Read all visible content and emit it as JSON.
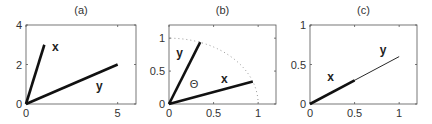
{
  "chart_data": [
    {
      "type": "line",
      "title": "(a)",
      "xlim": [
        0,
        6
      ],
      "ylim": [
        0,
        4
      ],
      "xticks": [
        0,
        5
      ],
      "yticks": [
        0,
        2,
        4
      ],
      "grid": false,
      "series": [
        {
          "name": "x",
          "x": [
            0,
            1
          ],
          "y": [
            0,
            3
          ],
          "style": "thick"
        },
        {
          "name": "y",
          "x": [
            0,
            5
          ],
          "y": [
            0,
            2
          ],
          "style": "thick"
        }
      ],
      "annotations": [
        {
          "text": "x",
          "x": 1.6,
          "y": 2.9
        },
        {
          "text": "y",
          "x": 4.0,
          "y": 0.9
        }
      ]
    },
    {
      "type": "line",
      "title": "(b)",
      "xlim": [
        0,
        1.2
      ],
      "ylim": [
        0,
        1.2
      ],
      "xticks": [
        0,
        0.5,
        1
      ],
      "yticks": [
        0,
        0.5,
        1
      ],
      "grid": false,
      "series": [
        {
          "name": "x",
          "x": [
            0,
            0.94
          ],
          "y": [
            0,
            0.34
          ],
          "style": "thick"
        },
        {
          "name": "y",
          "x": [
            0,
            0.35
          ],
          "y": [
            0,
            0.94
          ],
          "style": "thick"
        },
        {
          "name": "unit circle",
          "type": "arc",
          "radius": 1,
          "style": "dotted"
        }
      ],
      "annotations": [
        {
          "text": "y",
          "x": 0.12,
          "y": 0.78
        },
        {
          "text": "x",
          "x": 0.62,
          "y": 0.38
        },
        {
          "text": "Θ",
          "x": 0.28,
          "y": 0.3
        }
      ]
    },
    {
      "type": "line",
      "title": "(c)",
      "xlim": [
        0,
        1.2
      ],
      "ylim": [
        0,
        1
      ],
      "xticks": [
        0,
        0.5,
        1
      ],
      "yticks": [
        0,
        0.5,
        1
      ],
      "grid": false,
      "series": [
        {
          "name": "y",
          "x": [
            0,
            1
          ],
          "y": [
            0,
            0.6
          ],
          "style": "thin"
        },
        {
          "name": "x",
          "x": [
            0,
            0.5
          ],
          "y": [
            0,
            0.3
          ],
          "style": "thick"
        }
      ],
      "annotations": [
        {
          "text": "x",
          "x": 0.23,
          "y": 0.34
        },
        {
          "text": "y",
          "x": 0.82,
          "y": 0.68
        }
      ]
    }
  ]
}
